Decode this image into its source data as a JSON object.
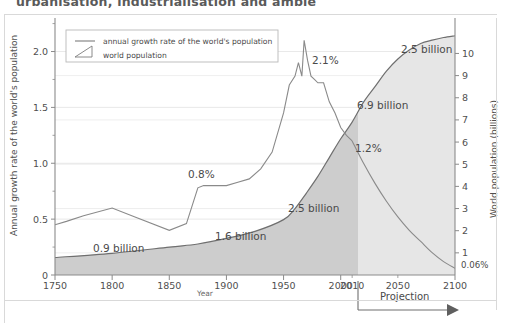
{
  "page": {
    "clipped_heading": "urbanisation, industrialisation and ambiental"
  },
  "chart_data": {
    "type": "line",
    "title": "",
    "xlabel": "Year",
    "ylabel": "Annual growth rate of the world's population",
    "y2label": "World population (billions)",
    "xlim": [
      1750,
      2100
    ],
    "ylim": [
      0,
      2.3
    ],
    "y2lim": [
      0,
      11.6
    ],
    "grid": true,
    "legend_position": "top-left",
    "xticks": [
      1750,
      1800,
      1850,
      1900,
      1950,
      2000,
      2010,
      2050,
      2100
    ],
    "xticklabels": [
      "1750",
      "1800",
      "1850",
      "1900",
      "1950",
      "2000",
      "2010",
      "2050",
      "2100"
    ],
    "yticks": [
      0,
      0.5,
      1.0,
      1.5,
      2.0
    ],
    "yticklabels": [
      "0",
      "0.5",
      "1.0",
      "1.5",
      "2.0"
    ],
    "y2ticks": [
      1,
      2,
      3,
      4,
      5,
      6,
      7,
      8,
      9,
      10
    ],
    "y2ticklabels": [
      "1",
      "2",
      "3",
      "4",
      "5",
      "6",
      "7",
      "8",
      "9",
      "10"
    ],
    "y2_extra_label": "0.06%",
    "legend": [
      {
        "key": "growth-rate",
        "label": "annual growth rate of the world's population",
        "marker": "line"
      },
      {
        "key": "population",
        "label": "world population",
        "marker": "area"
      }
    ],
    "series": [
      {
        "name": "annual growth rate of the world's population",
        "axis": "left",
        "unit": "%",
        "color": "#8a8a8a",
        "x": [
          1750,
          1760,
          1775,
          1800,
          1820,
          1850,
          1865,
          1875,
          1880,
          1890,
          1900,
          1910,
          1920,
          1930,
          1940,
          1950,
          1955,
          1960,
          1963,
          1966,
          1968,
          1971,
          1974,
          1977,
          1980,
          1985,
          1990,
          1995,
          2000,
          2005,
          2010,
          2020,
          2030,
          2040,
          2050,
          2060,
          2070,
          2080,
          2090,
          2100
        ],
        "y": [
          0.45,
          0.48,
          0.53,
          0.6,
          0.52,
          0.4,
          0.46,
          0.78,
          0.8,
          0.8,
          0.8,
          0.83,
          0.86,
          0.95,
          1.1,
          1.45,
          1.7,
          1.78,
          1.9,
          1.78,
          2.1,
          1.92,
          1.78,
          1.75,
          1.72,
          1.72,
          1.55,
          1.45,
          1.32,
          1.25,
          1.2,
          1.0,
          0.82,
          0.66,
          0.52,
          0.4,
          0.3,
          0.2,
          0.12,
          0.06
        ]
      },
      {
        "name": "world population",
        "axis": "right",
        "unit": "billions",
        "color": "#6f6f6f",
        "x": [
          1750,
          1800,
          1850,
          1875,
          1900,
          1925,
          1950,
          1960,
          1970,
          1980,
          1990,
          2000,
          2010,
          2020,
          2030,
          2040,
          2050,
          2060,
          2070,
          2080,
          2090,
          2100
        ],
        "y": [
          0.79,
          0.98,
          1.26,
          1.4,
          1.65,
          1.97,
          2.5,
          3.0,
          3.7,
          4.45,
          5.3,
          6.15,
          6.9,
          7.8,
          8.5,
          9.2,
          9.75,
          10.15,
          10.45,
          10.6,
          10.72,
          10.8
        ]
      }
    ],
    "annotations": [
      {
        "key": "pop-1800",
        "text": "0.9 billion"
      },
      {
        "key": "pop-1900",
        "text": "1.6 billion"
      },
      {
        "key": "pop-1950",
        "text": "2.5 billion"
      },
      {
        "key": "pop-2010",
        "text": "6.9 billion"
      },
      {
        "key": "pop-2100-added",
        "text": "2.5 billion"
      },
      {
        "key": "rate-1900",
        "text": "0.8%"
      },
      {
        "key": "rate-peak",
        "text": "2.1%"
      },
      {
        "key": "rate-2010",
        "text": "1.2%"
      },
      {
        "key": "rate-2100",
        "text": "0.06%"
      }
    ],
    "projection": {
      "label": "Projection",
      "start_year": 2010,
      "end_year": 2100
    },
    "colors": {
      "area_historic": "#cdcdcd",
      "area_projection": "#e6e6e6",
      "grid": "#e2e2e2",
      "axis": "#8b8b8b",
      "text": "#4f4f4f"
    }
  }
}
